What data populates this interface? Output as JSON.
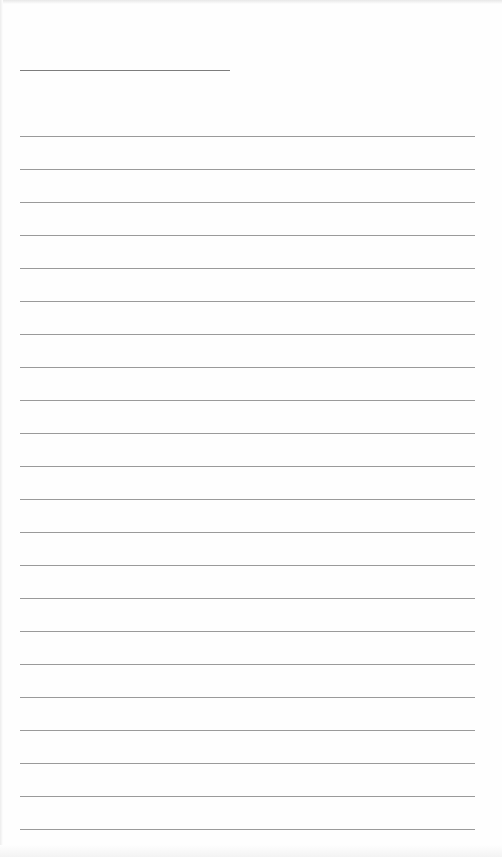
{
  "page": {
    "type": "lined-sheet",
    "background": "#fefefe",
    "line_color": "#9a9a9a",
    "header_line": {
      "x": 20,
      "y": 70,
      "width": 210
    },
    "rules": {
      "x": 20,
      "width": 455,
      "start_y": 136,
      "spacing": 33,
      "count": 22
    }
  }
}
